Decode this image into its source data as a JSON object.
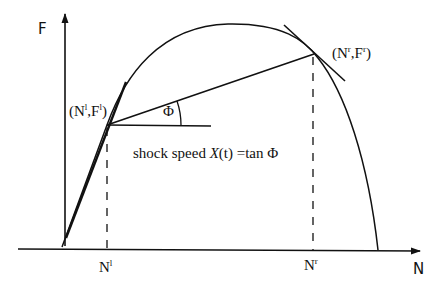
{
  "diagram": {
    "axes": {
      "y_label": "F",
      "x_label": "N"
    },
    "points": {
      "left": {
        "open": "(",
        "n": "N",
        "n_sup": "l",
        "sep": ",",
        "f": "F",
        "f_sup": "l",
        "close": ")"
      },
      "right": {
        "open": "(",
        "n": "N",
        "n_sup": "r",
        "sep": ",",
        "f": "F",
        "f_sup": "r",
        "close": ")"
      }
    },
    "ticks": {
      "left": {
        "base": "N",
        "sup": "l"
      },
      "right": {
        "base": "N",
        "sup": "r"
      }
    },
    "angle_label": "Φ",
    "annotation": {
      "prefix": "shock speed ",
      "symbol": "X",
      "arg": "(t) =tan ",
      "angle": "Φ"
    },
    "colors": {
      "stroke": "#111111",
      "background": "#ffffff"
    }
  }
}
